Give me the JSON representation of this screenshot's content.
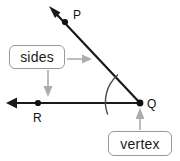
{
  "diagram": {
    "background_color": "#ffffff",
    "stroke_color": "#1a1a1a",
    "callout_color": "#9a9a9a",
    "points": [
      {
        "id": "P",
        "label": "P",
        "x": 65,
        "y": 22,
        "label_x": 73,
        "label_y": 18
      },
      {
        "id": "Q",
        "label": "Q",
        "x": 140,
        "y": 103,
        "label_x": 148,
        "label_y": 107
      },
      {
        "id": "R",
        "label": "R",
        "x": 38,
        "y": 103,
        "label_x": 38,
        "label_y": 119
      }
    ],
    "rays": [
      {
        "id": "ray-QP",
        "from": "Q",
        "through": "P",
        "arrow_x": 50,
        "arrow_y": 7
      },
      {
        "id": "ray-QR",
        "from": "Q",
        "through": "R",
        "arrow_x": 7,
        "arrow_y": 103
      }
    ],
    "angle_arc": {
      "center_x": 140,
      "center_y": 103,
      "radius": 36
    },
    "callouts": [
      {
        "id": "sides",
        "label": "sides",
        "points_to": [
          "ray-QP",
          "ray-QR"
        ]
      },
      {
        "id": "vertex",
        "label": "vertex",
        "points_to": [
          "Q"
        ]
      }
    ]
  }
}
